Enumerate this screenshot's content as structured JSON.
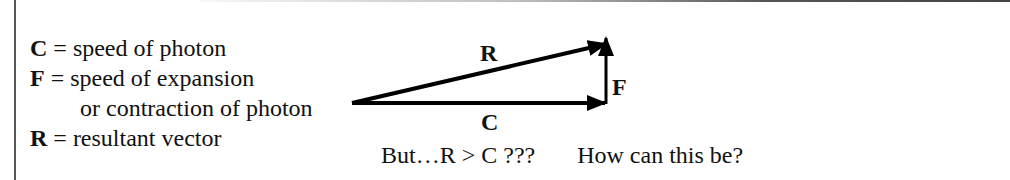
{
  "legend": [
    {
      "symbol": "C",
      "definition": "= speed of photon"
    },
    {
      "symbol": "F",
      "definition": "= speed of expansion"
    },
    {
      "symbol": "",
      "definition": "or contraction of photon"
    },
    {
      "symbol": "R",
      "definition": "= resultant vector"
    }
  ],
  "diagram": {
    "vectors": [
      {
        "label": "C",
        "description": "horizontal vector"
      },
      {
        "label": "F",
        "description": "vertical vector"
      },
      {
        "label": "R",
        "description": "resultant (hypotenuse) vector"
      }
    ]
  },
  "caption": {
    "question": "But…R > C ???",
    "follow_up": "How can this be?"
  }
}
